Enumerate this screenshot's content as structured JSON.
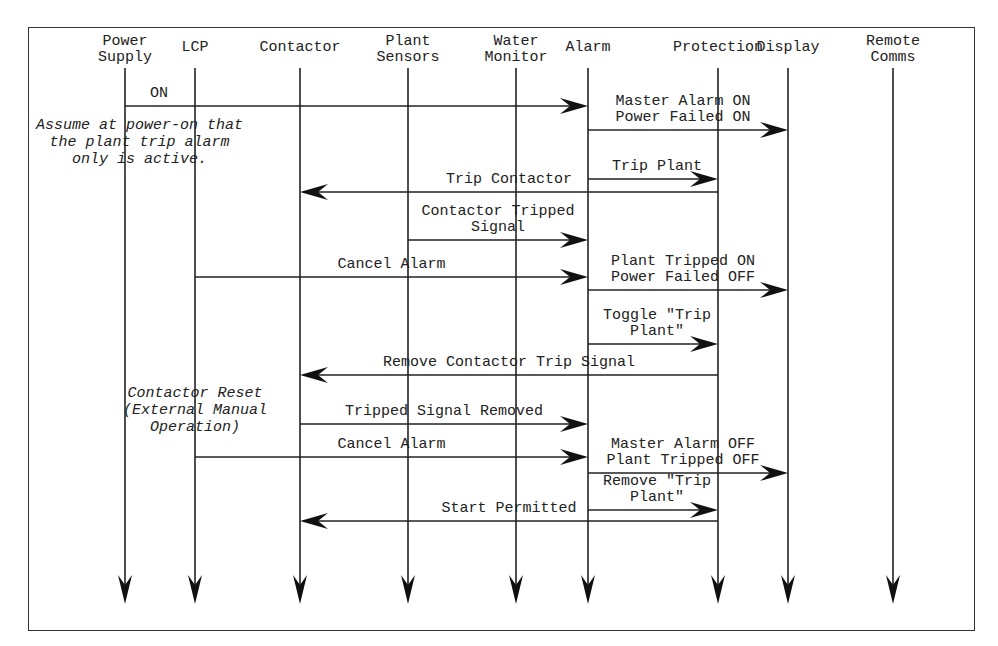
{
  "diagram": {
    "type": "sequence",
    "participants": [
      {
        "id": "power_supply",
        "label": "Power\nSupply",
        "x": 125
      },
      {
        "id": "lcp",
        "label": "LCP",
        "x": 195
      },
      {
        "id": "contactor",
        "label": "Contactor",
        "x": 300
      },
      {
        "id": "plant_sensors",
        "label": "Plant\nSensors",
        "x": 408
      },
      {
        "id": "water_monitor",
        "label": "Water\nMonitor",
        "x": 516
      },
      {
        "id": "alarm",
        "label": "Alarm",
        "x": 588
      },
      {
        "id": "protection",
        "label": "Protection",
        "x": 718
      },
      {
        "id": "display",
        "label": "Display",
        "x": 788
      },
      {
        "id": "remote_comms",
        "label": "Remote\nComms",
        "x": 893
      }
    ],
    "messages": [
      {
        "from": "power_supply",
        "to": "alarm",
        "y": 106,
        "label": "ON"
      },
      {
        "from": "alarm",
        "to": "display",
        "y": 130,
        "label": "Master Alarm ON\nPower Failed ON"
      },
      {
        "from": "alarm",
        "to": "protection",
        "y": 179,
        "label": "Trip Plant"
      },
      {
        "from": "protection",
        "to": "contactor",
        "y": 192,
        "label": "Trip Contactor"
      },
      {
        "from": "plant_sensors",
        "to": "alarm",
        "y": 240,
        "label": "Contactor Tripped\nSignal"
      },
      {
        "from": "lcp",
        "to": "alarm",
        "y": 277,
        "label": "Cancel Alarm"
      },
      {
        "from": "alarm",
        "to": "display",
        "y": 290,
        "label": "Plant Tripped ON\nPower Failed OFF"
      },
      {
        "from": "alarm",
        "to": "protection",
        "y": 344,
        "label": "Toggle \"Trip\nPlant\""
      },
      {
        "from": "protection",
        "to": "contactor",
        "y": 375,
        "label": "Remove Contactor Trip Signal"
      },
      {
        "from": "contactor",
        "to": "alarm",
        "y": 424,
        "label": "Tripped Signal Removed"
      },
      {
        "from": "lcp",
        "to": "alarm",
        "y": 457,
        "label": "Cancel Alarm"
      },
      {
        "from": "alarm",
        "to": "display",
        "y": 473,
        "label": "Master Alarm OFF\nPlant Tripped OFF"
      },
      {
        "from": "alarm",
        "to": "protection",
        "y": 510,
        "label": "Remove \"Trip\nPlant\""
      },
      {
        "from": "protection",
        "to": "contactor",
        "y": 521,
        "label": "Start Permitted"
      }
    ],
    "notes": [
      {
        "text": "Assume at power-on that\nthe plant trip alarm\nonly is active.",
        "x": 36,
        "y": 117
      },
      {
        "text": "Contactor Reset\n(External Manual\nOperation)",
        "x": 123,
        "y": 385
      }
    ]
  }
}
